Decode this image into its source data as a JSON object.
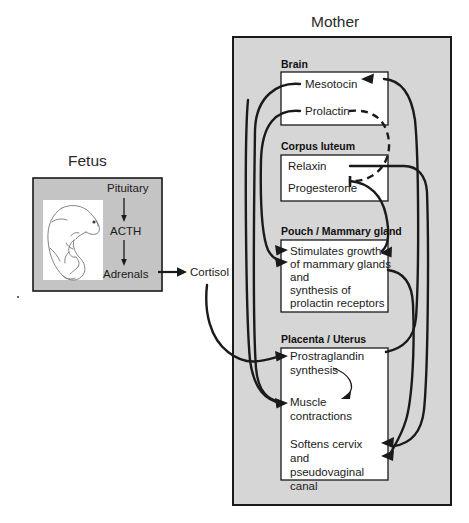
{
  "diagram": {
    "title_fetus": "Fetus",
    "title_mother": "Mother",
    "colors": {
      "panel_fill": "#c9c9c9",
      "inner_fill": "#ffffff",
      "stroke": "#1a1a1a",
      "text": "#1a1a1a",
      "mother_fill": "#d6d6d6"
    }
  },
  "fetus": {
    "label": "Fetus",
    "pituitary": "Pituitary",
    "acth": "ACTH",
    "adrenals": "Adrenals",
    "image_caption": "marsupial-fetus-drawing"
  },
  "cortisol": {
    "label": "Cortisol"
  },
  "mother": {
    "label": "Mother",
    "sections": [
      {
        "header": "Brain",
        "items": [
          "Mesotocin",
          "Prolactin"
        ]
      },
      {
        "header": "Corpus luteum",
        "items": [
          "Relaxin",
          "Progesterone"
        ]
      },
      {
        "header": "Pouch / Mammary gland",
        "items": [
          "Stimulates growth",
          "of mammary glands",
          "and",
          "synthesis of",
          "prolactin receptors"
        ]
      },
      {
        "header": "Placenta / Uterus",
        "items": [
          "Prostraglandin",
          "synthesis",
          "Muscle",
          "contractions",
          "Softens cervix",
          "and",
          "pseudovaginal",
          "canal"
        ]
      }
    ]
  }
}
